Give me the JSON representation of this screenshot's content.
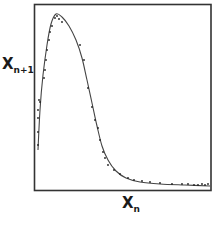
{
  "chart_data": {
    "type": "scatter",
    "title": "",
    "xlabel": "X_n",
    "ylabel": "X_n+1",
    "xlabel_main": "X",
    "xlabel_sub": "n",
    "ylabel_main": "X",
    "ylabel_sub": "n+1",
    "grid": false,
    "legend": null,
    "axis_ticks": "none",
    "frame": {
      "left": 34,
      "top": 4,
      "right": 211,
      "bottom": 190
    },
    "colors": {
      "frame": "#333333",
      "curve": "#444444",
      "points": "#222222"
    },
    "fit_curve": {
      "description": "unimodal return map: steep rise to peak near left, long decaying tail to the right",
      "points_px": [
        [
          38,
          150
        ],
        [
          40,
          110
        ],
        [
          43,
          75
        ],
        [
          47,
          45
        ],
        [
          51,
          24
        ],
        [
          56,
          14
        ],
        [
          62,
          17
        ],
        [
          69,
          26
        ],
        [
          76,
          40
        ],
        [
          82,
          58
        ],
        [
          87,
          80
        ],
        [
          92,
          103
        ],
        [
          97,
          126
        ],
        [
          102,
          146
        ],
        [
          108,
          160
        ],
        [
          116,
          171
        ],
        [
          126,
          178
        ],
        [
          140,
          182
        ],
        [
          160,
          184
        ],
        [
          185,
          185
        ],
        [
          210,
          186
        ]
      ]
    },
    "points_px": [
      [
        38,
        110
      ],
      [
        38,
        118
      ],
      [
        39,
        100
      ],
      [
        38,
        132
      ],
      [
        38,
        145
      ],
      [
        40,
        102
      ],
      [
        44,
        78
      ],
      [
        45,
        70
      ],
      [
        46,
        60
      ],
      [
        47,
        50
      ],
      [
        49,
        40
      ],
      [
        50,
        32
      ],
      [
        52,
        26
      ],
      [
        55,
        18
      ],
      [
        57,
        16
      ],
      [
        59,
        19
      ],
      [
        62,
        22
      ],
      [
        80,
        45
      ],
      [
        84,
        60
      ],
      [
        88,
        88
      ],
      [
        92,
        107
      ],
      [
        95,
        120
      ],
      [
        98,
        128
      ],
      [
        100,
        140
      ],
      [
        103,
        152
      ],
      [
        105,
        158
      ],
      [
        108,
        165
      ],
      [
        114,
        170
      ],
      [
        120,
        174
      ],
      [
        128,
        178
      ],
      [
        134,
        180
      ],
      [
        142,
        181
      ],
      [
        150,
        182
      ],
      [
        160,
        183
      ],
      [
        172,
        184
      ],
      [
        182,
        184
      ],
      [
        188,
        184
      ],
      [
        194,
        185
      ],
      [
        198,
        185
      ],
      [
        202,
        184
      ],
      [
        205,
        185
      ],
      [
        208,
        184
      ]
    ]
  }
}
